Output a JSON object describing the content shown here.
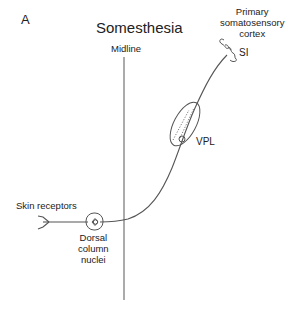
{
  "figure": {
    "panel_label": "A",
    "title": "Somesthesia",
    "midline_label": "Midline",
    "cortex_label_lines": [
      "Primary",
      "somatosensory",
      "cortex"
    ],
    "cortex_area_label": "SI",
    "thalamus_label": "VPL",
    "receptor_label": "Skin receptors",
    "nucleus_label_lines": [
      "Dorsal",
      "column",
      "nuclei"
    ]
  },
  "colors": {
    "line": "#555555",
    "text": "#222222",
    "background": "#ffffff"
  }
}
